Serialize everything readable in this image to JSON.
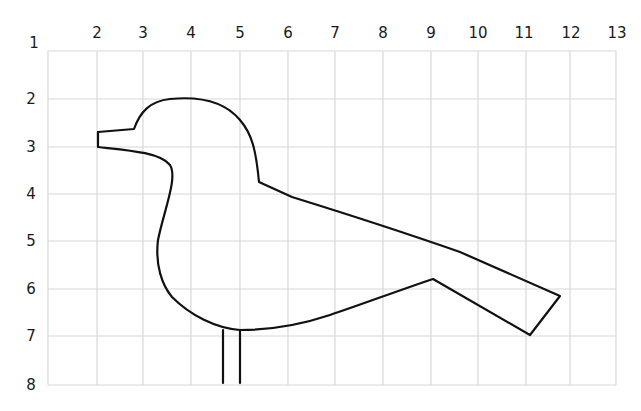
{
  "diagram": {
    "corner_label": "1",
    "x_labels": [
      "2",
      "3",
      "4",
      "5",
      "6",
      "7",
      "8",
      "9",
      "10",
      "11",
      "12",
      "13"
    ],
    "y_labels": [
      "2",
      "3",
      "4",
      "5",
      "6",
      "7",
      "8"
    ],
    "colors": {
      "grid": "#d8d8d8",
      "outline": "#111111",
      "background": "#ffffff"
    },
    "grid": {
      "cols_px": [
        48,
        97,
        143,
        191,
        240,
        288,
        335,
        383,
        431,
        478,
        526,
        570,
        616
      ],
      "rows_px": [
        51,
        99,
        147,
        194,
        241,
        289,
        336,
        385
      ]
    }
  }
}
